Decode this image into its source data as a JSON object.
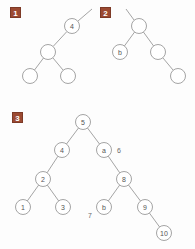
{
  "figure": {
    "background": "#fdfdfd",
    "edge_color": "#9a9a9a",
    "node_fill": "#ffffff",
    "node_stroke": "#9a9a9a",
    "label_color": "#555555",
    "badge_color": "#9c4a32",
    "badge_text_color": "#ffffff"
  },
  "panels": [
    {
      "badge": "1",
      "badge_x": 10,
      "badge_y": 7,
      "origin_x": 0,
      "origin_y": 0,
      "node_radius": 7.5,
      "nodes": [
        {
          "id": "p1n4",
          "label": "4",
          "x": 72,
          "y": 26
        },
        {
          "id": "p1mid",
          "label": "",
          "x": 48,
          "y": 52
        },
        {
          "id": "p1left",
          "label": "",
          "x": 30,
          "y": 76
        },
        {
          "id": "p1right",
          "label": "",
          "x": 68,
          "y": 76
        }
      ],
      "stubs": [
        {
          "from_x": 78,
          "from_y": 21,
          "to_x": 92,
          "to_y": 9
        }
      ],
      "edges": [
        {
          "from": "p1n4",
          "to": "p1mid"
        },
        {
          "from": "p1mid",
          "to": "p1left"
        },
        {
          "from": "p1mid",
          "to": "p1right"
        }
      ],
      "side_labels": []
    },
    {
      "badge": "2",
      "badge_x": 100,
      "badge_y": 7,
      "origin_x": 0,
      "origin_y": 0,
      "node_radius": 7.5,
      "nodes": [
        {
          "id": "p2root",
          "label": "",
          "x": 139,
          "y": 26
        },
        {
          "id": "p2b",
          "label": "b",
          "x": 120,
          "y": 52
        },
        {
          "id": "p2mid",
          "label": "",
          "x": 158,
          "y": 52
        },
        {
          "id": "p2leaf",
          "label": "",
          "x": 178,
          "y": 76
        }
      ],
      "stubs": [
        {
          "from_x": 134,
          "from_y": 20,
          "to_x": 126,
          "to_y": 9
        }
      ],
      "edges": [
        {
          "from": "p2root",
          "to": "p2b"
        },
        {
          "from": "p2root",
          "to": "p2mid"
        },
        {
          "from": "p2mid",
          "to": "p2leaf"
        }
      ],
      "side_labels": []
    },
    {
      "badge": "3",
      "badge_x": 12,
      "badge_y": 112,
      "origin_x": 0,
      "origin_y": 0,
      "node_radius": 7.5,
      "nodes": [
        {
          "id": "p3n5",
          "label": "5",
          "x": 83,
          "y": 122
        },
        {
          "id": "p3n4",
          "label": "4",
          "x": 62,
          "y": 150
        },
        {
          "id": "p3na",
          "label": "a",
          "x": 104,
          "y": 150
        },
        {
          "id": "p3n2",
          "label": "2",
          "x": 43,
          "y": 179
        },
        {
          "id": "p3n8",
          "label": "8",
          "x": 124,
          "y": 179
        },
        {
          "id": "p3n1",
          "label": "1",
          "x": 23,
          "y": 207
        },
        {
          "id": "p3n3",
          "label": "3",
          "x": 63,
          "y": 207
        },
        {
          "id": "p3nb",
          "label": "b",
          "x": 104,
          "y": 207
        },
        {
          "id": "p3n9",
          "label": "9",
          "x": 145,
          "y": 207
        },
        {
          "id": "p3n10",
          "label": "10",
          "x": 164,
          "y": 233
        }
      ],
      "stubs": [],
      "edges": [
        {
          "from": "p3n5",
          "to": "p3n4"
        },
        {
          "from": "p3n5",
          "to": "p3na"
        },
        {
          "from": "p3n4",
          "to": "p3n2"
        },
        {
          "from": "p3na",
          "to": "p3n8"
        },
        {
          "from": "p3n2",
          "to": "p3n1"
        },
        {
          "from": "p3n2",
          "to": "p3n3"
        },
        {
          "from": "p3n8",
          "to": "p3nb"
        },
        {
          "from": "p3n8",
          "to": "p3n9"
        },
        {
          "from": "p3n9",
          "to": "p3n10"
        }
      ],
      "side_labels": [
        {
          "id": "p3lbl6",
          "text": "6",
          "x": 119,
          "y": 150
        },
        {
          "id": "p3lbl7",
          "text": "7",
          "x": 90,
          "y": 215
        }
      ]
    }
  ]
}
